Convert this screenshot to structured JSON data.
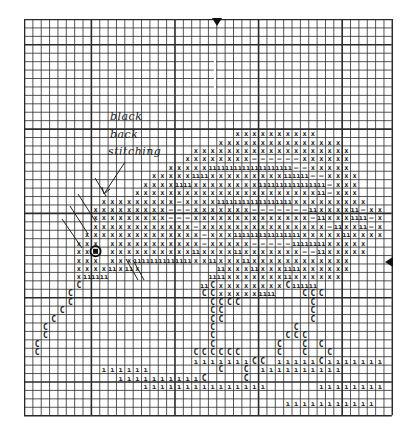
{
  "chart_title": "Cross-stitch pattern chart (fish)",
  "annotation": {
    "line1": "black",
    "line2": "back",
    "line3": "stitching"
  },
  "markers": {
    "top": "center-column-arrow",
    "right": "center-row-arrow"
  },
  "grid": {
    "cols": 44,
    "rows": 47,
    "cell_w": 8.36,
    "cell_h": 8.43,
    "major_every": 10,
    "major_col_offset": 8,
    "major_row_offset": 3,
    "line_color": "#2a2a2a"
  },
  "legend_symbols": {
    "x": "cross stitch",
    "=": "double bar",
    "-": "dash",
    "C": "c symbol",
    "|": "single bar",
    "o": "eye (black)"
  },
  "chart_data": {
    "type": "table",
    "rows": [
      "............................................",
      "............................................",
      "............................................",
      "............................................",
      "............................................",
      "............................................",
      "............................................",
      "............................................",
      "............................................",
      "............................................",
      "............................................",
      "............................................",
      "............................................",
      ".........................xxxxxxxxxx.........",
      ".......................xxxxxxxxxxxxxxx......",
      "....................xxxxxxxxxxxxxxxxxxx.....",
      "...................xxxxxxxx------xxxxxx.....",
      ".................xxxxx==========--xxxxx.....",
      "...............xxxxx==xxxxxxxxx===--xxxx....",
      "..............xxxx==xxxxxxxx========-xxx....",
      ".............xxxxxxxxxxxxxxxxxxxxxx=-xxx....",
      ".........xxxxxxxxx-xxxx=========xxxxxxxxx...",
      "........xxxxxxxxx---xxxxxxx-------=xxxx=-xx.",
      "........xxxxxxxxx---xxxxxxxxxxxxxx-=xxx==-x.",
      "........xxxxxxxxxxxx-xxxxxxxxxxxxxxx-=xx=-x.",
      ".......xxxxxxxxxxxxxx-xxx========xxxxx=xxxx.",
      "......xxx.xxxxxxxxxxx-xxxxx-----====xxxxx...",
      "......xxo.xxxxxxxxxx=xxxx=xxxxxxx--=xxxxx...",
      "......xxx.xxx=======xx=xxx=xxxxxxxxxxxx.....",
      "......xxxx=x=x.........=xxx=xxx==xxxxxx.....",
      "......x===............==xxxxxxx=xxxxxx......",
      "......C..............=CxxxxxxxxC===........",
      ".....C...............CCxxxxx==...CCC........",
      ".....C................CCCC........C........",
      "....C.................CC..........C........",
      "...C..................CC..........C........",
      "..C...................C.........C.........",
      "..C...................C........CCC........",
      ".C....................C.......C..C.C......",
      ".C..................CCCCCC....C..C..C.....",
      "....................|||||||CC.|||||C|||||||",
      ".........||||||........C..C.||||||||||.....",
      "...........||||||||||C....C................",
      "..............|||||||||||||||......||||||||",
      "............................................",
      "...............................|||||||||||.",
      "............................................"
    ],
    "xlabel": "",
    "ylabel": ""
  }
}
